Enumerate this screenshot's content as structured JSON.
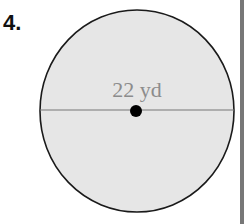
{
  "problem": {
    "number": "4.",
    "shape": "circle",
    "measurement": "diameter",
    "label": "22 yd",
    "value": 22,
    "unit": "yd"
  },
  "colors": {
    "fill": "#e6e6e6",
    "stroke": "#1a1a1a",
    "label": "#8c8c8c",
    "diameter_line": "#777777"
  }
}
